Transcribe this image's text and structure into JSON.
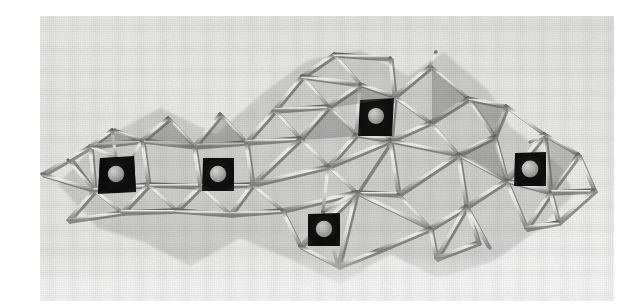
{
  "figure": {
    "kind": "photograph",
    "alt_text": "Black and white photograph of a physical ball-and-stick model of a silicate-type framework: pale rods joined into a corrugated sheet of corner-sharing tetrahedra, with five dark square cavities each holding a light grey sphere.",
    "medium": "halftone printed photograph",
    "background_color": "#e7e7e5",
    "rod_color": "#f3f3f1",
    "rod_shadow_color": "#4b4b4b",
    "cavity_color": "#131313",
    "sphere_color": "#b9b9b7",
    "paper_color": "#ffffff"
  },
  "model": {
    "name": "framework-model",
    "description": "Corrugated network of corner-linked tetrahedra built from light-coloured rods",
    "cavity_count": 5,
    "sphere_count": 5,
    "cavities": [
      {
        "id": "cavity-1",
        "label": "left cavity",
        "cx": 76,
        "cy": 158,
        "size": 34,
        "sphere_r": 8
      },
      {
        "id": "cavity-2",
        "label": "left-centre cavity",
        "cx": 178,
        "cy": 158,
        "size": 32,
        "sphere_r": 8
      },
      {
        "id": "cavity-3",
        "label": "upper cavity",
        "cx": 336,
        "cy": 100,
        "size": 34,
        "sphere_r": 8
      },
      {
        "id": "cavity-4",
        "label": "lower cavity",
        "cx": 283,
        "cy": 213,
        "size": 32,
        "sphere_r": 8
      },
      {
        "id": "cavity-5",
        "label": "right cavity",
        "cx": 490,
        "cy": 153,
        "size": 32,
        "sphere_r": 8
      }
    ]
  },
  "print": {
    "photo_width": 574,
    "photo_height": 285,
    "canvas_width": 593,
    "canvas_height": 299
  }
}
